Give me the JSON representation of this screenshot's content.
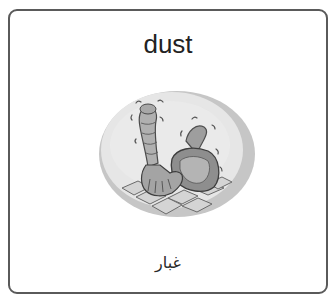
{
  "card": {
    "word": "dust",
    "translation": "غبار",
    "illustration": {
      "icon": "dustpan-and-glove-icon",
      "description": "gloved hand sweeping dust into a dustpan on tiles"
    }
  },
  "colors": {
    "border": "#5a5a5a",
    "text": "#222222",
    "oval_outer": "#c6c6c6",
    "oval_inner": "#e6e6e6"
  }
}
